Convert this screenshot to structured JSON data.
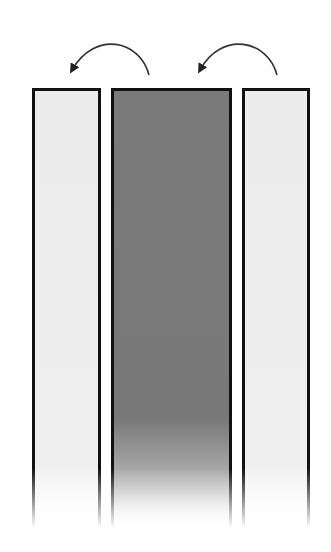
{
  "diagram": {
    "colors": {
      "light_fill": "#ececec",
      "dark_fill": "#7a7a7a",
      "border": "#111111",
      "arrow": "#333333"
    },
    "columns": [
      {
        "id": "left",
        "shade": "light",
        "x": 32,
        "width": 69
      },
      {
        "id": "middle",
        "shade": "dark",
        "x": 111,
        "width": 121
      },
      {
        "id": "right",
        "shade": "light",
        "x": 242,
        "width": 68
      }
    ],
    "arrows": [
      {
        "id": "arrow-1",
        "from": "middle",
        "to": "left",
        "direction": "counterclockwise"
      },
      {
        "id": "arrow-2",
        "from": "right",
        "to": "middle",
        "direction": "counterclockwise"
      }
    ]
  }
}
